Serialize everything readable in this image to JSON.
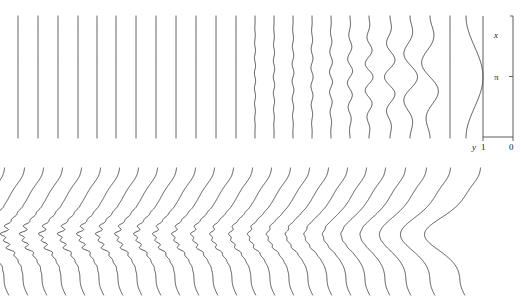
{
  "figure": {
    "type": "scientific-line-figure",
    "background_color": "#ffffff",
    "curve_color": "#2b2b2b",
    "axis_color": "#4a4a4a",
    "width": 521,
    "height": 301
  },
  "axes": {
    "vertical_axis_label": "x",
    "vertical_tick_label": "π",
    "horizontal_axis_label": "y",
    "horizontal_tick_left": "1",
    "horizontal_tick_right": "0",
    "x_axis_left_px": 483,
    "x_axis_right_px": 513,
    "axis_top_px": 16,
    "axis_bottom_px": 137
  },
  "chart_data": {
    "type": "line",
    "title": "",
    "subtitle": "",
    "xlabel": "y",
    "ylabel": "x",
    "legend": [],
    "grid": false,
    "panels": [
      {
        "name": "top-panel",
        "description": "Family of vertical curves: straight lines on the left evolving into oscillatory modes of decreasing frequency and increasing amplitude toward the right.",
        "x_range_px": [
          18,
          478
        ],
        "y_range_px": [
          16,
          138
        ],
        "axis_ranges": {
          "x_axis": [
            0,
            1
          ],
          "y_axis": [
            0,
            "pi"
          ]
        },
        "n_curves": 24,
        "curves": [
          {
            "index": 0,
            "base_x": 18,
            "freq": 0.0,
            "amp": 0.0
          },
          {
            "index": 1,
            "base_x": 38,
            "freq": 0.0,
            "amp": 0.0
          },
          {
            "index": 2,
            "base_x": 58,
            "freq": 0.0,
            "amp": 0.0
          },
          {
            "index": 3,
            "base_x": 78,
            "freq": 0.0,
            "amp": 0.0
          },
          {
            "index": 4,
            "base_x": 97,
            "freq": 0.0,
            "amp": 0.0
          },
          {
            "index": 5,
            "base_x": 116,
            "freq": 0.0,
            "amp": 0.0
          },
          {
            "index": 6,
            "base_x": 136,
            "freq": 0.0,
            "amp": 0.0
          },
          {
            "index": 7,
            "base_x": 156,
            "freq": 0.0,
            "amp": 0.0
          },
          {
            "index": 8,
            "base_x": 176,
            "freq": 0.0,
            "amp": 0.0
          },
          {
            "index": 9,
            "base_x": 196,
            "freq": 0.0,
            "amp": 0.0
          },
          {
            "index": 10,
            "base_x": 216,
            "freq": 0.0,
            "amp": 0.0
          },
          {
            "index": 11,
            "base_x": 236,
            "freq": 0.0,
            "amp": 0.0
          },
          {
            "index": 12,
            "base_x": 255,
            "freq": 16.0,
            "amp": 0.6
          },
          {
            "index": 13,
            "base_x": 274,
            "freq": 15.0,
            "amp": 0.7
          },
          {
            "index": 14,
            "base_x": 293,
            "freq": 14.0,
            "amp": 0.9
          },
          {
            "index": 15,
            "base_x": 312,
            "freq": 13.0,
            "amp": 1.1
          },
          {
            "index": 16,
            "base_x": 331,
            "freq": 12.0,
            "amp": 1.5
          },
          {
            "index": 17,
            "base_x": 350,
            "freq": 10.0,
            "amp": 2.6
          },
          {
            "index": 18,
            "base_x": 369,
            "freq": 9.0,
            "amp": 4.0
          },
          {
            "index": 19,
            "base_x": 390,
            "freq": 7.0,
            "amp": 5.5
          },
          {
            "index": 20,
            "base_x": 410,
            "freq": 5.0,
            "amp": 7.5
          },
          {
            "index": 21,
            "base_x": 430,
            "freq": 4.0,
            "amp": 9.0
          },
          {
            "index": 22,
            "base_x": 450,
            "freq": 0.0,
            "amp": 0.0
          },
          {
            "index": 23,
            "base_x": 466,
            "freq": 1.0,
            "amp": 17.0
          }
        ]
      },
      {
        "name": "bottom-panel",
        "description": "Waterfall stack of slanted peaked profiles; left profiles show fine ripples on the shoulder, right profiles become smooth broad peaks.",
        "x_range_px": [
          2,
          500
        ],
        "y_range_px": [
          168,
          295
        ],
        "n_curves": 25,
        "profiles": [
          {
            "index": 0,
            "base_x": 2,
            "ripple": 1.0,
            "peak": 1.0
          },
          {
            "index": 1,
            "base_x": 22,
            "ripple": 0.98,
            "peak": 1.0
          },
          {
            "index": 2,
            "base_x": 41,
            "ripple": 0.96,
            "peak": 1.0
          },
          {
            "index": 3,
            "base_x": 60,
            "ripple": 0.94,
            "peak": 1.01
          },
          {
            "index": 4,
            "base_x": 79,
            "ripple": 0.91,
            "peak": 1.01
          },
          {
            "index": 5,
            "base_x": 98,
            "ripple": 0.88,
            "peak": 1.02
          },
          {
            "index": 6,
            "base_x": 117,
            "ripple": 0.85,
            "peak": 1.02
          },
          {
            "index": 7,
            "base_x": 136,
            "ripple": 0.81,
            "peak": 1.03
          },
          {
            "index": 8,
            "base_x": 155,
            "ripple": 0.77,
            "peak": 1.03
          },
          {
            "index": 9,
            "base_x": 174,
            "ripple": 0.73,
            "peak": 1.04
          },
          {
            "index": 10,
            "base_x": 193,
            "ripple": 0.68,
            "peak": 1.05
          },
          {
            "index": 11,
            "base_x": 212,
            "ripple": 0.63,
            "peak": 1.06
          },
          {
            "index": 12,
            "base_x": 231,
            "ripple": 0.58,
            "peak": 1.07
          },
          {
            "index": 13,
            "base_x": 250,
            "ripple": 0.52,
            "peak": 1.08
          },
          {
            "index": 14,
            "base_x": 269,
            "ripple": 0.47,
            "peak": 1.09
          },
          {
            "index": 15,
            "base_x": 288,
            "ripple": 0.41,
            "peak": 1.11
          },
          {
            "index": 16,
            "base_x": 307,
            "ripple": 0.35,
            "peak": 1.13
          },
          {
            "index": 17,
            "base_x": 326,
            "ripple": 0.29,
            "peak": 1.15
          },
          {
            "index": 18,
            "base_x": 345,
            "ripple": 0.23,
            "peak": 1.18
          },
          {
            "index": 19,
            "base_x": 364,
            "ripple": 0.17,
            "peak": 1.22
          },
          {
            "index": 20,
            "base_x": 383,
            "ripple": 0.12,
            "peak": 1.26
          },
          {
            "index": 21,
            "base_x": 403,
            "ripple": 0.07,
            "peak": 1.32
          },
          {
            "index": 22,
            "base_x": 424,
            "ripple": 0.03,
            "peak": 1.42
          },
          {
            "index": 23,
            "base_x": 448,
            "ripple": 0.0,
            "peak": 1.6
          },
          {
            "index": 24,
            "base_x": 478,
            "ripple": 0.0,
            "peak": 1.95
          }
        ]
      }
    ]
  }
}
